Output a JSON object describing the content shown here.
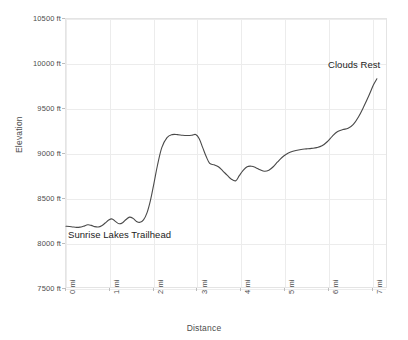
{
  "chart_data": {
    "type": "line",
    "title": "",
    "subtitle": "",
    "xlabel": "Distance",
    "ylabel": "Elevation",
    "xlim": [
      0,
      7.35
    ],
    "ylim": [
      7500,
      10500
    ],
    "grid": true,
    "legend": null,
    "legend_position": "none",
    "line_color": "#4a4a4a",
    "grid_color": "#ececec",
    "x_tick_values": [
      0,
      1,
      2,
      3,
      4,
      5,
      6,
      7
    ],
    "x_tick_labels": [
      "0 mi",
      "1 mi",
      "2 mi",
      "3 mi",
      "4 mi",
      "5 mi",
      "6 mi",
      "7 mi"
    ],
    "y_tick_values": [
      7500,
      8000,
      8500,
      9000,
      9500,
      10000,
      10500
    ],
    "y_tick_labels": [
      "7500 ft",
      "8000 ft",
      "8500 ft",
      "9000 ft",
      "9500 ft",
      "10000 ft",
      "10500 ft"
    ],
    "x_unit": "mi",
    "y_unit": "ft",
    "series": [
      {
        "name": "Sunrise Lakes Trail to Clouds Rest",
        "x": [
          0.0,
          0.08,
          0.16,
          0.24,
          0.32,
          0.4,
          0.5,
          0.58,
          0.66,
          0.74,
          0.82,
          0.9,
          0.98,
          1.06,
          1.14,
          1.22,
          1.3,
          1.38,
          1.46,
          1.54,
          1.62,
          1.7,
          1.78,
          1.86,
          1.94,
          2.02,
          2.1,
          2.2,
          2.32,
          2.44,
          2.56,
          2.68,
          2.8,
          2.9,
          2.98,
          3.06,
          3.14,
          3.22,
          3.3,
          3.4,
          3.5,
          3.6,
          3.7,
          3.8,
          3.9,
          3.98,
          4.06,
          4.16,
          4.26,
          4.36,
          4.46,
          4.56,
          4.66,
          4.76,
          4.86,
          4.96,
          5.06,
          5.16,
          5.28,
          5.4,
          5.52,
          5.64,
          5.76,
          5.88,
          6.0,
          6.12,
          6.24,
          6.36,
          6.48,
          6.6,
          6.72,
          6.84,
          6.96,
          7.06,
          7.14
        ],
        "y": [
          8180,
          8178,
          8172,
          8168,
          8170,
          8180,
          8196,
          8190,
          8176,
          8172,
          8186,
          8216,
          8250,
          8262,
          8232,
          8208,
          8220,
          8256,
          8282,
          8268,
          8234,
          8224,
          8252,
          8330,
          8470,
          8660,
          8860,
          9060,
          9172,
          9206,
          9206,
          9198,
          9196,
          9200,
          9206,
          9160,
          9060,
          8960,
          8884,
          8868,
          8846,
          8800,
          8752,
          8706,
          8690,
          8746,
          8800,
          8846,
          8852,
          8836,
          8812,
          8796,
          8808,
          8846,
          8900,
          8950,
          8986,
          9010,
          9028,
          9040,
          9046,
          9052,
          9060,
          9080,
          9126,
          9190,
          9240,
          9262,
          9276,
          9320,
          9406,
          9520,
          9646,
          9760,
          9830
        ]
      }
    ],
    "annotations": [
      {
        "name": "trailhead",
        "text": "Sunrise Lakes Trailhead",
        "x": 0.07,
        "y": 8055
      },
      {
        "name": "summit",
        "text": "Clouds Rest",
        "x": 5.92,
        "y": 10000
      }
    ]
  }
}
